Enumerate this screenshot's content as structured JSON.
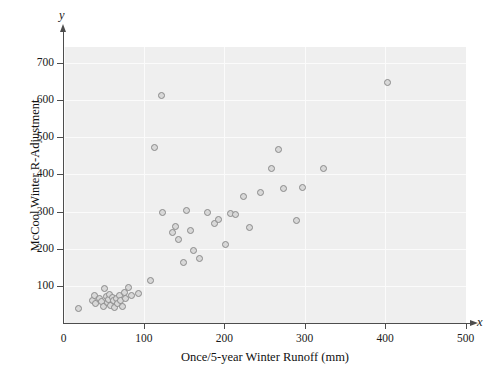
{
  "chart_data": {
    "type": "scatter",
    "title": "",
    "xlabel": "Once/5-year Winter Runoff (mm)",
    "ylabel": "McCool Winter R-Adjustment",
    "x_axis_letter": "x",
    "y_axis_letter": "y",
    "xlim": [
      0,
      500
    ],
    "ylim": [
      0,
      740
    ],
    "xticks": [
      0,
      100,
      200,
      300,
      400,
      500
    ],
    "xtick_labels": [
      "0",
      "100",
      "200",
      "300",
      "400",
      "500"
    ],
    "yticks": [
      100,
      200,
      300,
      400,
      500,
      600,
      700
    ],
    "ytick_labels": [
      "100",
      "200",
      "300",
      "400",
      "500",
      "600",
      "700"
    ],
    "grid": true,
    "grid_color": "#fbfbfb",
    "panel_color": "#efefef",
    "marker_color": "#8a8a8a",
    "marker_fill": "#d8d8d8",
    "legend": null,
    "points": [
      {
        "x": 17,
        "y": 42
      },
      {
        "x": 35,
        "y": 62
      },
      {
        "x": 37,
        "y": 78
      },
      {
        "x": 39,
        "y": 54
      },
      {
        "x": 44,
        "y": 70
      },
      {
        "x": 46,
        "y": 60
      },
      {
        "x": 48,
        "y": 46
      },
      {
        "x": 50,
        "y": 96
      },
      {
        "x": 52,
        "y": 74
      },
      {
        "x": 53,
        "y": 58
      },
      {
        "x": 55,
        "y": 66
      },
      {
        "x": 56,
        "y": 80
      },
      {
        "x": 57,
        "y": 50
      },
      {
        "x": 59,
        "y": 72
      },
      {
        "x": 61,
        "y": 64
      },
      {
        "x": 62,
        "y": 44
      },
      {
        "x": 64,
        "y": 68
      },
      {
        "x": 66,
        "y": 56
      },
      {
        "x": 68,
        "y": 78
      },
      {
        "x": 70,
        "y": 62
      },
      {
        "x": 72,
        "y": 48
      },
      {
        "x": 74,
        "y": 84
      },
      {
        "x": 76,
        "y": 70
      },
      {
        "x": 79,
        "y": 98
      },
      {
        "x": 83,
        "y": 76
      },
      {
        "x": 92,
        "y": 82
      },
      {
        "x": 107,
        "y": 118
      },
      {
        "x": 112,
        "y": 474
      },
      {
        "x": 120,
        "y": 615
      },
      {
        "x": 122,
        "y": 301
      },
      {
        "x": 134,
        "y": 247
      },
      {
        "x": 138,
        "y": 262
      },
      {
        "x": 142,
        "y": 228
      },
      {
        "x": 148,
        "y": 166
      },
      {
        "x": 152,
        "y": 305
      },
      {
        "x": 157,
        "y": 253
      },
      {
        "x": 160,
        "y": 198
      },
      {
        "x": 168,
        "y": 176
      },
      {
        "x": 178,
        "y": 300
      },
      {
        "x": 186,
        "y": 270
      },
      {
        "x": 192,
        "y": 282
      },
      {
        "x": 200,
        "y": 215
      },
      {
        "x": 206,
        "y": 298
      },
      {
        "x": 213,
        "y": 296
      },
      {
        "x": 222,
        "y": 343
      },
      {
        "x": 230,
        "y": 259
      },
      {
        "x": 244,
        "y": 353
      },
      {
        "x": 258,
        "y": 420
      },
      {
        "x": 266,
        "y": 470
      },
      {
        "x": 272,
        "y": 365
      },
      {
        "x": 288,
        "y": 278
      },
      {
        "x": 296,
        "y": 368
      },
      {
        "x": 322,
        "y": 418
      },
      {
        "x": 402,
        "y": 650
      }
    ]
  }
}
